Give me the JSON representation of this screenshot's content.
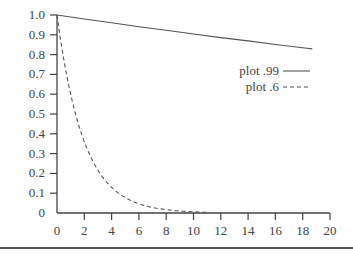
{
  "chart_data": {
    "type": "line",
    "title": "",
    "xlabel": "",
    "ylabel": "",
    "xlim": [
      0,
      20
    ],
    "ylim": [
      0,
      1.0
    ],
    "grid": false,
    "legend_position": "right-middle",
    "x_ticks": [
      0,
      2,
      4,
      6,
      8,
      10,
      12,
      14,
      16,
      18,
      20
    ],
    "y_ticks": [
      0,
      0.1,
      0.2,
      0.3,
      0.4,
      0.5,
      0.6,
      0.7,
      0.8,
      0.9,
      1.0
    ],
    "x_tick_labels": [
      "0",
      "2",
      "4",
      "6",
      "8",
      "10",
      "12",
      "14",
      "16",
      "18",
      "20"
    ],
    "y_tick_labels": [
      "0",
      "0.1",
      "0.2",
      "0.3",
      "0.4",
      "0.5",
      "0.6",
      "0.7",
      "0.8",
      "0.9",
      "1.0"
    ],
    "series": [
      {
        "name": "plot .99",
        "style": "solid",
        "function": "0.99^x",
        "x": [
          0,
          2,
          4,
          6,
          8,
          10,
          12,
          14,
          16,
          18,
          18.7
        ],
        "values": [
          1.0,
          0.98,
          0.961,
          0.941,
          0.923,
          0.904,
          0.886,
          0.869,
          0.851,
          0.835,
          0.829
        ]
      },
      {
        "name": "plot .6",
        "style": "dashed",
        "function": "0.6^x",
        "x": [
          0,
          1,
          2,
          3,
          4,
          5,
          6,
          7,
          8,
          9,
          10,
          11
        ],
        "values": [
          1.0,
          0.6,
          0.36,
          0.216,
          0.13,
          0.078,
          0.047,
          0.028,
          0.017,
          0.01,
          0.006,
          0.004
        ]
      }
    ]
  },
  "legend": {
    "items": [
      {
        "label": "plot .99",
        "style": "solid"
      },
      {
        "label": "plot .6",
        "style": "dashed"
      }
    ]
  },
  "colors": {
    "axis": "#444444",
    "line": "#555555",
    "text": "#444444"
  }
}
